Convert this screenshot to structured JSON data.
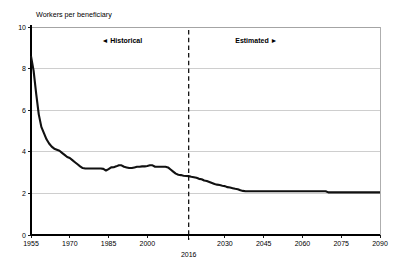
{
  "figure": {
    "ylabel": "Workers per beneficiary",
    "xlabel": "",
    "divider_label": "2016",
    "historical_label": "Historical",
    "estimated_label": "Estimated",
    "historical_arrow": "◄",
    "estimated_arrow": "►",
    "accent_color": "#111111",
    "grid_color": "#b9b9b9",
    "axis_color": "#000000",
    "background_color": "#ffffff"
  },
  "chart_data": {
    "type": "line",
    "title": "",
    "ylabel": "Workers per beneficiary",
    "xlabel": "",
    "xlim": [
      1955,
      2090
    ],
    "ylim": [
      0,
      10
    ],
    "yticks": [
      0,
      2,
      4,
      6,
      8,
      10
    ],
    "ytick_labels": [
      "0",
      "2",
      "4",
      "6",
      "8",
      "10"
    ],
    "xticks": [
      1955,
      1970,
      1985,
      2000,
      2030,
      2045,
      2060,
      2075,
      2090
    ],
    "xtick_labels": [
      "1955",
      "1970",
      "1985",
      "2000",
      "2030",
      "2045",
      "2060",
      "2075",
      "2090"
    ],
    "grid": true,
    "grid_axis": "y",
    "legend": "none",
    "annotations": [
      {
        "type": "vline",
        "x": 2016,
        "label": "2016",
        "style": "dashed"
      },
      {
        "type": "text",
        "x": 1998,
        "y": 9.25,
        "text": "◄ Historical"
      },
      {
        "type": "text",
        "x": 2034,
        "y": 9.25,
        "text": "Estimated ►"
      }
    ],
    "series": [
      {
        "name": "Workers per beneficiary",
        "x": [
          1955,
          1956,
          1957,
          1958,
          1959,
          1960,
          1961,
          1962,
          1963,
          1964,
          1965,
          1966,
          1967,
          1968,
          1969,
          1970,
          1971,
          1972,
          1973,
          1974,
          1975,
          1976,
          1977,
          1978,
          1979,
          1980,
          1981,
          1982,
          1983,
          1984,
          1985,
          1986,
          1987,
          1988,
          1989,
          1990,
          1991,
          1992,
          1993,
          1994,
          1995,
          1996,
          1997,
          1998,
          1999,
          2000,
          2001,
          2002,
          2003,
          2004,
          2005,
          2006,
          2007,
          2008,
          2009,
          2010,
          2011,
          2012,
          2013,
          2014,
          2015,
          2016,
          2017,
          2018,
          2019,
          2020,
          2021,
          2022,
          2023,
          2024,
          2025,
          2026,
          2027,
          2028,
          2029,
          2030,
          2031,
          2032,
          2033,
          2034,
          2035,
          2036,
          2037,
          2038,
          2040,
          2045,
          2050,
          2055,
          2060,
          2065,
          2069,
          2070,
          2075,
          2080,
          2085,
          2090
        ],
        "y": [
          8.6,
          7.9,
          6.8,
          5.8,
          5.2,
          4.9,
          4.6,
          4.4,
          4.25,
          4.15,
          4.1,
          4.05,
          3.95,
          3.85,
          3.75,
          3.7,
          3.6,
          3.5,
          3.4,
          3.3,
          3.22,
          3.2,
          3.2,
          3.2,
          3.2,
          3.2,
          3.2,
          3.2,
          3.18,
          3.1,
          3.17,
          3.25,
          3.26,
          3.3,
          3.35,
          3.35,
          3.28,
          3.25,
          3.22,
          3.22,
          3.25,
          3.28,
          3.28,
          3.3,
          3.3,
          3.32,
          3.35,
          3.35,
          3.28,
          3.28,
          3.28,
          3.28,
          3.28,
          3.25,
          3.15,
          3.05,
          2.95,
          2.9,
          2.88,
          2.85,
          2.84,
          2.83,
          2.8,
          2.78,
          2.75,
          2.7,
          2.68,
          2.62,
          2.6,
          2.55,
          2.5,
          2.45,
          2.42,
          2.4,
          2.37,
          2.35,
          2.3,
          2.28,
          2.25,
          2.22,
          2.2,
          2.15,
          2.12,
          2.1,
          2.1,
          2.1,
          2.1,
          2.1,
          2.1,
          2.1,
          2.1,
          2.05,
          2.05,
          2.05,
          2.05,
          2.05
        ]
      }
    ]
  }
}
